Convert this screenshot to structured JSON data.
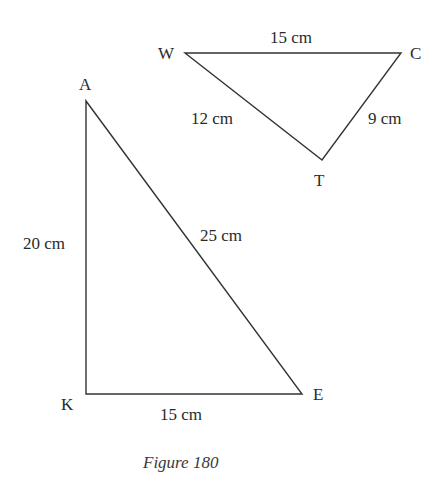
{
  "figure": {
    "caption": "Figure 180",
    "colors": {
      "line": "#333333",
      "text": "#2a2a2a",
      "background": "#ffffff"
    },
    "triangles": [
      {
        "name": "WTC",
        "vertices": [
          {
            "label": "W",
            "x": 185,
            "y": 53,
            "lx": 158,
            "ly": 59
          },
          {
            "label": "C",
            "x": 401,
            "y": 53,
            "lx": 410,
            "ly": 59
          },
          {
            "label": "T",
            "x": 322,
            "y": 160,
            "lx": 314,
            "ly": 186
          }
        ],
        "sides": [
          {
            "from": "W",
            "to": "C",
            "length": "15 cm",
            "lx": 270,
            "ly": 43
          },
          {
            "from": "W",
            "to": "T",
            "length": "12 cm",
            "lx": 191,
            "ly": 124
          },
          {
            "from": "T",
            "to": "C",
            "length": "9 cm",
            "lx": 368,
            "ly": 124
          }
        ]
      },
      {
        "name": "AKE",
        "vertices": [
          {
            "label": "A",
            "x": 86,
            "y": 101,
            "lx": 79,
            "ly": 90
          },
          {
            "label": "K",
            "x": 86,
            "y": 394,
            "lx": 61,
            "ly": 410
          },
          {
            "label": "E",
            "x": 302,
            "y": 394,
            "lx": 313,
            "ly": 400
          }
        ],
        "sides": [
          {
            "from": "A",
            "to": "K",
            "length": "20 cm",
            "lx": 23,
            "ly": 249
          },
          {
            "from": "A",
            "to": "E",
            "length": "25 cm",
            "lx": 200,
            "ly": 241
          },
          {
            "from": "K",
            "to": "E",
            "length": "15 cm",
            "lx": 160,
            "ly": 420
          }
        ]
      }
    ]
  }
}
